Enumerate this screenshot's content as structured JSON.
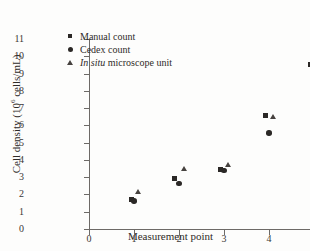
{
  "chart_data": {
    "type": "scatter",
    "title": "",
    "xlabel": "Measurement point",
    "ylabel": "Cell density (10⁶ cells/mL)",
    "ylabel_prefix": "Cell density (10",
    "ylabel_exponent": "6",
    "ylabel_suffix": " cells/mL)",
    "xlim": [
      0,
      5.6
    ],
    "ylim": [
      0,
      11
    ],
    "xticks": [
      "0",
      "1",
      "2",
      "3",
      "4",
      "5"
    ],
    "yticks": [
      "0",
      "1",
      "2",
      "3",
      "4",
      "5",
      "6",
      "7",
      "8",
      "9",
      "10",
      "11"
    ],
    "xtick_values": [
      0,
      1,
      2,
      3,
      4,
      5
    ],
    "ytick_values": [
      0,
      1,
      2,
      3,
      4,
      5,
      6,
      7,
      8,
      9,
      10,
      11
    ],
    "grid": false,
    "legend_position": "upper-left",
    "marker_color": "#2b2826",
    "axis_color": "#6d6a67",
    "series": [
      {
        "name": "Manual count",
        "marker": "square",
        "label_italic_part": "",
        "points": [
          {
            "x": 0.95,
            "y": 1.68
          },
          {
            "x": 1.9,
            "y": 2.95
          },
          {
            "x": 2.92,
            "y": 3.42
          },
          {
            "x": 3.92,
            "y": 6.55
          },
          {
            "x": 4.92,
            "y": 9.55
          }
        ]
      },
      {
        "name": "Cedex count",
        "marker": "circle",
        "label_italic_part": "",
        "points": [
          {
            "x": 1.0,
            "y": 1.63
          },
          {
            "x": 2.0,
            "y": 2.63
          },
          {
            "x": 3.0,
            "y": 3.38
          },
          {
            "x": 4.0,
            "y": 5.55
          },
          {
            "x": 5.0,
            "y": 8.45
          }
        ]
      },
      {
        "name": "In situ microscope unit",
        "marker": "triangle",
        "label_italic_part": "In situ",
        "label_rest": " microscope unit",
        "points": [
          {
            "x": 1.1,
            "y": 2.15
          },
          {
            "x": 2.12,
            "y": 3.45
          },
          {
            "x": 3.1,
            "y": 3.7
          },
          {
            "x": 4.1,
            "y": 6.45
          },
          {
            "x": 5.08,
            "y": 9.85
          }
        ]
      }
    ]
  }
}
